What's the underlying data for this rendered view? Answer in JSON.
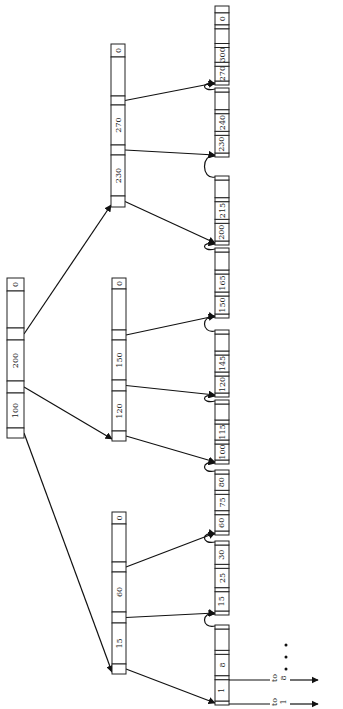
{
  "diagram": {
    "type": "b-plus-tree",
    "orientation": "rotated-90-ccw",
    "colors": {
      "stroke": "#222222",
      "background": "#ffffff"
    },
    "root": {
      "id": "root",
      "x": 7,
      "w": 17,
      "segments": [
        {
          "kind": "key",
          "label": "0",
          "y0": 278,
          "y1": 291
        },
        {
          "kind": "blank",
          "label": "",
          "y0": 291,
          "y1": 328
        },
        {
          "kind": "ptr",
          "label": "",
          "y0": 328,
          "y1": 340,
          "to": "internal-c"
        },
        {
          "kind": "key",
          "label": "200",
          "y0": 340,
          "y1": 381
        },
        {
          "kind": "ptr",
          "label": "",
          "y0": 381,
          "y1": 393,
          "to": "internal-b"
        },
        {
          "kind": "key",
          "label": "100",
          "y0": 393,
          "y1": 428
        },
        {
          "kind": "ptr",
          "label": "",
          "y0": 428,
          "y1": 438,
          "to": "internal-a"
        }
      ]
    },
    "internal": [
      {
        "id": "internal-c",
        "x": 111,
        "w": 14,
        "segments": [
          {
            "kind": "key",
            "label": "0",
            "y0": 44,
            "y1": 57
          },
          {
            "kind": "blank",
            "label": "",
            "y0": 57,
            "y1": 96
          },
          {
            "kind": "ptr",
            "label": "",
            "y0": 96,
            "y1": 105,
            "to": "leaf-9"
          },
          {
            "kind": "key",
            "label": "270",
            "y0": 105,
            "y1": 145
          },
          {
            "kind": "ptr",
            "label": "",
            "y0": 145,
            "y1": 155,
            "to": "leaf-8"
          },
          {
            "kind": "key",
            "label": "230",
            "y0": 155,
            "y1": 196
          },
          {
            "kind": "ptr",
            "label": "",
            "y0": 196,
            "y1": 207,
            "to": "leaf-7"
          }
        ]
      },
      {
        "id": "internal-b",
        "x": 112,
        "w": 14,
        "segments": [
          {
            "kind": "key",
            "label": "0",
            "y0": 278,
            "y1": 289
          },
          {
            "kind": "blank",
            "label": "",
            "y0": 289,
            "y1": 330
          },
          {
            "kind": "ptr",
            "label": "",
            "y0": 330,
            "y1": 340,
            "to": "leaf-6"
          },
          {
            "kind": "key",
            "label": "150",
            "y0": 340,
            "y1": 380
          },
          {
            "kind": "ptr",
            "label": "",
            "y0": 380,
            "y1": 391,
            "to": "leaf-5"
          },
          {
            "kind": "key",
            "label": "120",
            "y0": 391,
            "y1": 431
          },
          {
            "kind": "ptr",
            "label": "",
            "y0": 431,
            "y1": 441,
            "to": "leaf-4"
          }
        ]
      },
      {
        "id": "internal-a",
        "x": 112,
        "w": 14,
        "segments": [
          {
            "kind": "key",
            "label": "0",
            "y0": 512,
            "y1": 524
          },
          {
            "kind": "blank",
            "label": "",
            "y0": 524,
            "y1": 562
          },
          {
            "kind": "ptr",
            "label": "",
            "y0": 562,
            "y1": 572,
            "to": "leaf-3"
          },
          {
            "kind": "key",
            "label": "60",
            "y0": 572,
            "y1": 612
          },
          {
            "kind": "ptr",
            "label": "",
            "y0": 612,
            "y1": 623,
            "to": "leaf-2"
          },
          {
            "kind": "key",
            "label": "15",
            "y0": 623,
            "y1": 664
          },
          {
            "kind": "ptr",
            "label": "",
            "y0": 664,
            "y1": 674,
            "to": "leaf-1"
          }
        ]
      }
    ],
    "leaves": {
      "x": 215,
      "w": 14,
      "nodes": [
        {
          "id": "leaf-1",
          "keys": [
            "1",
            "8",
            ""
          ],
          "y0": 625,
          "y1": 705
        },
        {
          "id": "leaf-2",
          "keys": [
            "15",
            "25",
            "30"
          ],
          "y0": 541,
          "y1": 615
        },
        {
          "id": "leaf-3",
          "keys": [
            "60",
            "75",
            "80"
          ],
          "y0": 470,
          "y1": 535
        },
        {
          "id": "leaf-4",
          "keys": [
            "100",
            "115",
            ""
          ],
          "y0": 400,
          "y1": 464
        },
        {
          "id": "leaf-5",
          "keys": [
            "120",
            "145",
            ""
          ],
          "y0": 330,
          "y1": 397
        },
        {
          "id": "leaf-6",
          "keys": [
            "150",
            "165",
            ""
          ],
          "y0": 248,
          "y1": 318
        },
        {
          "id": "leaf-7",
          "keys": [
            "200",
            "215",
            ""
          ],
          "y0": 176,
          "y1": 245
        },
        {
          "id": "leaf-8",
          "keys": [
            "230",
            "240",
            ""
          ],
          "y0": 88,
          "y1": 157
        },
        {
          "id": "leaf-9",
          "keys": [
            "270",
            "300",
            "",
            "0"
          ],
          "y0": 6,
          "y1": 85
        }
      ]
    },
    "external_pointers": [
      {
        "label_top": "to",
        "label_bottom": "1",
        "y": 704
      },
      {
        "label_top": "to",
        "label_bottom": "8",
        "y": 680
      }
    ],
    "ellipsis": "• • •"
  }
}
